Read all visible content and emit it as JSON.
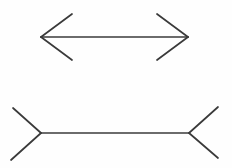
{
  "canvas": {
    "width": 232,
    "height": 168,
    "background_color": "#fefefe",
    "stroke_color": "#3b3b3b",
    "stroke_width": 1.7,
    "description": "Muller-Lyer illusion: two horizontal line segments of equal length, the upper one with outward-pointing arrowheads at both ends, the lower one with inward-pointing (fin-out) arrowheads at both ends.",
    "text_labels": []
  },
  "figures": [
    {
      "name": "top-figure",
      "label": "arrowheads-inward-pointing-shaft",
      "arrow_style": "arrowheads-point-outward-from-shaft",
      "shaft": {
        "x1": 41,
        "y1": 37,
        "x2": 188,
        "y2": 37
      },
      "fins": [
        {
          "name": "top-left-upper-fin",
          "x1": 41,
          "y1": 37,
          "x2": 72,
          "y2": 14
        },
        {
          "name": "top-left-lower-fin",
          "x1": 41,
          "y1": 37,
          "x2": 72,
          "y2": 60
        },
        {
          "name": "top-right-upper-fin",
          "x1": 188,
          "y1": 37,
          "x2": 157,
          "y2": 14
        },
        {
          "name": "top-right-lower-fin",
          "x1": 188,
          "y1": 37,
          "x2": 157,
          "y2": 60
        }
      ]
    },
    {
      "name": "bottom-figure",
      "label": "arrowheads-outward-pointing-shaft",
      "arrow_style": "fins-point-away-from-shaft",
      "shaft": {
        "x1": 41,
        "y1": 133,
        "x2": 189,
        "y2": 133
      },
      "fins": [
        {
          "name": "bottom-left-upper-fin",
          "x1": 41,
          "y1": 133,
          "x2": 13,
          "y2": 108
        },
        {
          "name": "bottom-left-lower-fin",
          "x1": 41,
          "y1": 133,
          "x2": 11,
          "y2": 160
        },
        {
          "name": "bottom-right-upper-fin",
          "x1": 189,
          "y1": 133,
          "x2": 218,
          "y2": 107
        },
        {
          "name": "bottom-right-lower-fin",
          "x1": 189,
          "y1": 133,
          "x2": 218,
          "y2": 158
        }
      ]
    }
  ]
}
